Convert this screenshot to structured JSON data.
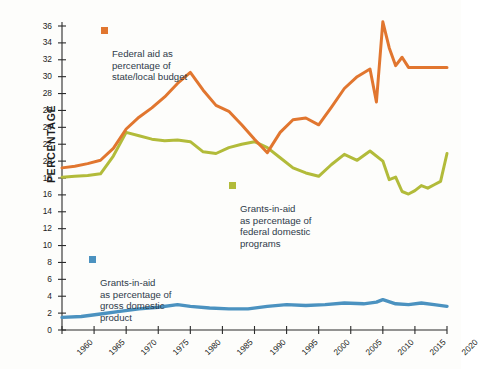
{
  "chart_data": {
    "type": "line",
    "title": "",
    "xlabel": "",
    "ylabel": "PERCENTAGE",
    "xlim": [
      1960,
      2020
    ],
    "ylim": [
      0,
      36
    ],
    "ytick_step": 2,
    "xtick_step": 5,
    "grid": false,
    "legend_position": "inside-plot",
    "x": [
      1960,
      1965,
      1970,
      1975,
      1980,
      1985,
      1990,
      1995,
      2000,
      2005,
      2010,
      2015,
      2020
    ],
    "xticklabels": [
      "1960",
      "1965",
      "1970",
      "1975",
      "1980",
      "1985",
      "1990",
      "1995",
      "2000",
      "2005",
      "2010",
      "2015",
      "2020"
    ],
    "yticklabels": [
      "0",
      "2",
      "4",
      "6",
      "8",
      "10",
      "12",
      "14",
      "16",
      "18",
      "20",
      "22",
      "24",
      "26",
      "28",
      "30",
      "32",
      "34",
      "36"
    ],
    "series": [
      {
        "name": "Federal aid as percentage of state/local budget",
        "legend_label": "Federal aid as\npercentage of\nstate/local budget",
        "color": "#e1762f",
        "x": [
          1960,
          1962,
          1964,
          1966,
          1968,
          1970,
          1972,
          1974,
          1976,
          1978,
          1980,
          1982,
          1984,
          1986,
          1988,
          1990,
          1992,
          1994,
          1996,
          1998,
          2000,
          2002,
          2004,
          2006,
          2008,
          2009,
          2010,
          2011,
          2012,
          2013,
          2014,
          2015,
          2016,
          2018,
          2020
        ],
        "values": [
          19.2,
          19.4,
          19.7,
          20.1,
          21.5,
          23.8,
          25.2,
          26.3,
          27.6,
          29.2,
          30.5,
          28.4,
          26.6,
          25.9,
          24.3,
          22.6,
          21.0,
          23.4,
          24.9,
          25.1,
          24.3,
          26.4,
          28.6,
          30.0,
          30.9,
          27.0,
          36.5,
          33.4,
          31.3,
          32.3,
          31.1,
          31.1,
          31.1,
          31.1,
          31.1
        ]
      },
      {
        "name": "Grants-in-aid as percentage of federal domestic programs",
        "legend_label": "Grants-in-aid\nas percentage of\nfederal domestic\nprograms",
        "color": "#b2bb3a",
        "x": [
          1960,
          1962,
          1964,
          1966,
          1968,
          1970,
          1972,
          1974,
          1976,
          1978,
          1980,
          1982,
          1984,
          1986,
          1988,
          1990,
          1992,
          1994,
          1996,
          1998,
          2000,
          2002,
          2004,
          2006,
          2008,
          2010,
          2011,
          2012,
          2013,
          2014,
          2015,
          2016,
          2017,
          2018,
          2019,
          2020
        ],
        "values": [
          18.1,
          18.2,
          18.3,
          18.5,
          20.6,
          23.4,
          23.0,
          22.6,
          22.4,
          22.5,
          22.3,
          21.1,
          20.9,
          21.6,
          22.0,
          22.3,
          21.6,
          20.4,
          19.2,
          18.6,
          18.2,
          19.6,
          20.8,
          20.1,
          21.2,
          20.0,
          17.8,
          18.1,
          16.4,
          16.1,
          16.5,
          17.1,
          16.8,
          17.2,
          17.6,
          20.9
        ]
      },
      {
        "name": "Grants-in-aid as percentage of gross domestic product",
        "legend_label": "Grants-in-aid\nas percentage of\ngross domestic\nproduct",
        "color": "#4b92c0",
        "x": [
          1960,
          1963,
          1966,
          1969,
          1972,
          1975,
          1978,
          1980,
          1983,
          1986,
          1989,
          1992,
          1995,
          1998,
          2001,
          2004,
          2007,
          2009,
          2010,
          2012,
          2014,
          2016,
          2018,
          2020
        ],
        "values": [
          1.5,
          1.6,
          1.9,
          2.2,
          2.5,
          2.7,
          3.0,
          2.8,
          2.6,
          2.5,
          2.5,
          2.8,
          3.0,
          2.9,
          3.0,
          3.2,
          3.1,
          3.3,
          3.6,
          3.1,
          3.0,
          3.2,
          3.0,
          2.8
        ]
      }
    ]
  }
}
